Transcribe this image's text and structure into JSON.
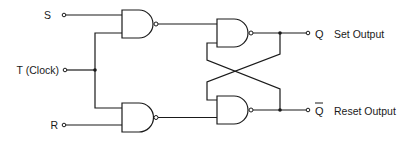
{
  "diagram": {
    "type": "circuit",
    "inputs": {
      "s": "S",
      "t": "T (Clock)",
      "r": "R"
    },
    "outputs": {
      "q": "Q",
      "q_label": "Set Output",
      "qbar": "Q",
      "qbar_label": "Reset Output"
    },
    "gates": [
      {
        "id": "gate-input-set",
        "kind": "NAND",
        "inputs": [
          "S",
          "T (Clock)"
        ]
      },
      {
        "id": "gate-input-reset",
        "kind": "NAND",
        "inputs": [
          "T (Clock)",
          "R"
        ]
      },
      {
        "id": "gate-latch-set",
        "kind": "NAND",
        "inputs": [
          "gate-input-set",
          "Q̄"
        ],
        "output": "Q"
      },
      {
        "id": "gate-latch-reset",
        "kind": "NAND",
        "inputs": [
          "Q",
          "gate-input-reset"
        ],
        "output": "Q̄"
      }
    ],
    "colors": {
      "ink": "#1a1a1a",
      "background": "#ffffff"
    }
  }
}
